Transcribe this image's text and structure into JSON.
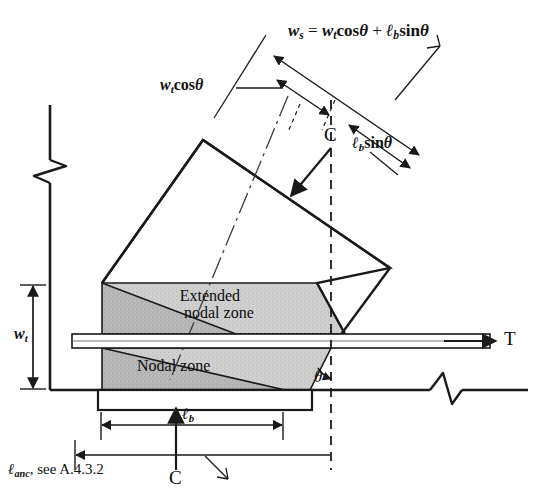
{
  "figure": {
    "name": "strut-and-tie-nodal-zone-diagram",
    "background_color": "#ffffff",
    "line_color": "#1a1a1a",
    "shade_color": "#cfcfcf",
    "shade_dark_color": "#a8a8a8"
  },
  "labels": {
    "ws_equation": {
      "ws": "w",
      "ws_sub": "s",
      "equals": " = ",
      "wt": "w",
      "wt_sub": "t",
      "cos": "cos",
      "theta": "θ",
      "plus": " + ",
      "lb": "ℓ",
      "lb_sub": "b",
      "sin": "sin",
      "full_text": "ws = wt cosθ + ℓb sinθ"
    },
    "wt_cos_theta": {
      "w": "w",
      "sub": "t",
      "trig": "cos",
      "theta": "θ",
      "full_text": "wt cosθ"
    },
    "lb_sin_theta": {
      "l": "ℓ",
      "sub": "b",
      "trig": "sin",
      "theta": "θ",
      "full_text": "ℓb sinθ"
    },
    "wt_dimension": {
      "w": "w",
      "sub": "t",
      "full_text": "wt"
    },
    "lb_dimension": {
      "l": "ℓ",
      "sub": "b",
      "full_text": "ℓb"
    },
    "lanc_note": {
      "l": "ℓ",
      "sub": "anc",
      "text": ", see A.4.3.2",
      "full_text": "ℓanc, see A.4.3.2"
    },
    "extended_nodal_zone_line1": "Extended",
    "extended_nodal_zone_line2": "nodal zone",
    "nodal_zone": "Nodal zone",
    "compression_top": "C",
    "compression_bottom": "C",
    "tension": "T",
    "theta_angle": "θ"
  }
}
